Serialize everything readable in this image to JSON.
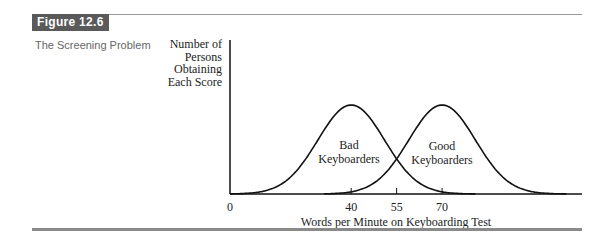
{
  "figure": {
    "label": "Figure 12.6",
    "caption": "The Screening Problem"
  },
  "chart_data": {
    "type": "line",
    "title": "The Screening Problem",
    "xlabel": "Words per Minute on Keyboarding Test",
    "ylabel": "Number of Persons Obtaining Each Score",
    "ylabel_lines": [
      "Number of",
      "Persons",
      "Obtaining",
      "Each Score"
    ],
    "x_ticks": [
      0,
      40,
      55,
      70
    ],
    "x_tick_labels": [
      "0",
      "40",
      "55",
      "70"
    ],
    "xlim": [
      0,
      116
    ],
    "grid": false,
    "legend": "none (curves labeled inline)",
    "series": [
      {
        "name": "Bad Keyboarders",
        "label_lines": [
          "Bad",
          "Keyboarders"
        ],
        "distribution": "normal",
        "mean": 40,
        "range": [
          0,
          81
        ],
        "peak_relative_height": 1.0
      },
      {
        "name": "Good Keyboarders",
        "label_lines": [
          "Good",
          "Keyboarders"
        ],
        "distribution": "normal",
        "mean": 70,
        "range": [
          31,
          111
        ],
        "peak_relative_height": 1.0
      }
    ],
    "annotations": [
      {
        "text": "Curves intersect at cutoff score 55",
        "x": 55
      }
    ]
  }
}
